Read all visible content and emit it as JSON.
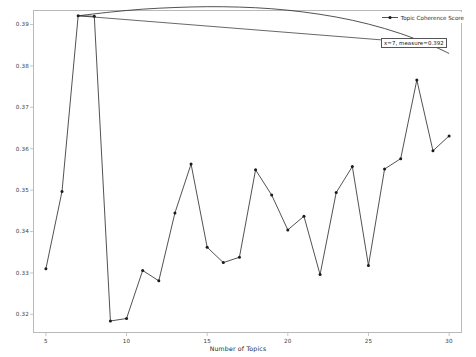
{
  "chart_data": {
    "type": "line",
    "title": "",
    "xlabel": "Number of Topics",
    "ylabel": "",
    "xlim": [
      4.2,
      30.8
    ],
    "ylim": [
      0.3155,
      0.3935
    ],
    "grid": false,
    "legend_position": "upper right",
    "series": [
      {
        "name": "Topic Coherence Score",
        "marker": "dot",
        "color": "#262626",
        "x": [
          5,
          6,
          7,
          8,
          9,
          10,
          11,
          12,
          13,
          14,
          15,
          16,
          17,
          18,
          19,
          20,
          21,
          22,
          23,
          24,
          25,
          26,
          27,
          28,
          29,
          30
        ],
        "values": [
          0.331,
          0.3497,
          0.3921,
          0.392,
          0.3184,
          0.319,
          0.3306,
          0.3281,
          0.3445,
          0.3563,
          0.3362,
          0.3325,
          0.3338,
          0.3549,
          0.3488,
          0.3404,
          0.3437,
          0.3296,
          0.3494,
          0.3557,
          0.3318,
          0.3551,
          0.3576,
          0.3766,
          0.3595,
          0.3631
        ]
      },
      {
        "name": "fitted-trend-curve",
        "marker": "none",
        "color": "#262626",
        "x": [
          7,
          9,
          11,
          13,
          15,
          17,
          19,
          21,
          23,
          25,
          27,
          29,
          30
        ],
        "values": [
          0.3921,
          0.393,
          0.3937,
          0.3941,
          0.3943,
          0.3942,
          0.3938,
          0.393,
          0.3918,
          0.3901,
          0.3878,
          0.3848,
          0.383
        ]
      }
    ],
    "xticks": [
      5,
      10,
      15,
      20,
      25,
      30
    ],
    "xtick_labels": [
      "5",
      "10",
      "15",
      "20",
      "25",
      "30"
    ],
    "yticks": [
      0.32,
      0.33,
      0.34,
      0.35,
      0.36,
      0.37,
      0.38,
      0.39
    ],
    "ytick_labels": [
      "0.32",
      "0.33",
      "0.34",
      "0.35",
      "0.36",
      "0.37",
      "0.38",
      "0.39"
    ],
    "annotations": [
      {
        "text": "x=7, measure=0.392",
        "x": 7,
        "value": 0.392
      }
    ]
  },
  "legend": {
    "entries": [
      {
        "label": "Topic Coherence Score",
        "color": "#262626",
        "marker": "dot"
      }
    ]
  },
  "colors": {
    "line": "#262626",
    "marker": "#1a1a1a",
    "frame": "#b9b9b9",
    "tick_text": "#3a3a3a",
    "background": "#ffffff",
    "annotation_border": "#555555"
  }
}
